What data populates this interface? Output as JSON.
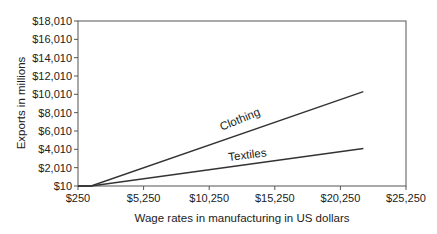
{
  "chart_data": {
    "type": "line",
    "title": "",
    "xlabel": "Wage rates in manufacturing in US dollars",
    "ylabel": "Exports in millions",
    "xlim": [
      250,
      25250
    ],
    "ylim": [
      10,
      18010
    ],
    "x_ticks": [
      "$250",
      "$5,250",
      "$10,250",
      "$15,250",
      "$20,250",
      "$25,250"
    ],
    "x_tick_values": [
      250,
      5250,
      10250,
      15250,
      20250,
      25250
    ],
    "y_ticks": [
      "$10",
      "$2,010",
      "$4,010",
      "$6,010",
      "$8,010",
      "$10,010",
      "$12,010",
      "$14,010",
      "$16,010",
      "$18,010"
    ],
    "y_tick_values": [
      10,
      2010,
      4010,
      6010,
      8010,
      10010,
      12010,
      14010,
      16010,
      18010
    ],
    "grid": false,
    "legend": "inline labels on lines",
    "series": [
      {
        "name": "Clothing",
        "x": [
          250,
          1250,
          22000
        ],
        "y": [
          10,
          10,
          10300
        ],
        "label_pos": {
          "x": 12700,
          "y": 6900,
          "angle": -22
        }
      },
      {
        "name": "Textiles",
        "x": [
          250,
          1250,
          22000
        ],
        "y": [
          10,
          10,
          4100
        ],
        "label_pos": {
          "x": 13200,
          "y": 3000,
          "angle": -7
        }
      }
    ]
  }
}
